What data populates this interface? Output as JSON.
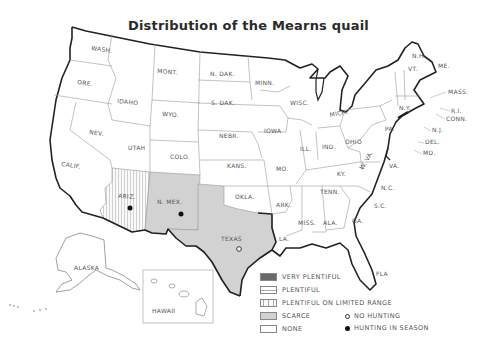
{
  "title": "Distribution of the Mearns quail",
  "colors": {
    "very_plentiful": "#6a6a6a",
    "plentiful": "#ffffff",
    "plentiful_limited": "#f4f4f4",
    "scarce": "#d2d2d2",
    "none": "#ffffff",
    "border": "#222222",
    "state_line": "#9a9a9a"
  },
  "states": {
    "wash": "WASH.",
    "ore": "ORE.",
    "calif": "CALIF.",
    "idaho": "IDAHO",
    "nev": "NEV.",
    "mont": "MONT.",
    "wyo": "WYO.",
    "utah": "UTAH",
    "colo": "COLO.",
    "ariz": "ARIZ.",
    "nmex": "N. MEX.",
    "ndak": "N. DAK.",
    "sdak": "S. DAK.",
    "nebr": "NEBR.",
    "kans": "KANS.",
    "okla": "OKLA.",
    "texas": "TEXAS",
    "minn": "MINN.",
    "iowa": "IOWA",
    "mo": "MO.",
    "ark": "ARK.",
    "la": "LA.",
    "wisc": "WISC.",
    "ill": "ILL.",
    "mich": "MICH.",
    "ind": "IND.",
    "ohio": "OHIO",
    "ky": "KY.",
    "tenn": "TENN.",
    "miss": "MISS.",
    "ala": "ALA.",
    "ga": "GA.",
    "fla": "FLA",
    "sc": "S.C.",
    "nc": "N.C.",
    "va": "VA.",
    "wva": "W. VA.",
    "pa": "PA.",
    "ny": "N.Y.",
    "vt": "VT.",
    "nh": "N.H.",
    "me": "ME.",
    "mass": "MASS.",
    "ri": "R.I.",
    "conn": "CONN.",
    "nj": "N.J.",
    "del": "DEL.",
    "md": "MD.",
    "alaska": "ALASKA",
    "hawaii": "HAWAII"
  },
  "legend": {
    "items": [
      {
        "label": "VERY PLENTIFUL",
        "key": "very_plentiful"
      },
      {
        "label": "PLENTIFUL",
        "key": "plentiful"
      },
      {
        "label": "PLENTIFUL ON LIMITED RANGE",
        "key": "plentiful_limited"
      },
      {
        "label": "SCARCE",
        "key": "scarce"
      },
      {
        "label": "NONE",
        "key": "none"
      }
    ],
    "hunting": [
      {
        "label": "NO HUNTING",
        "symbol": "open-circle"
      },
      {
        "label": "HUNTING IN SEASON",
        "symbol": "filled-circle"
      }
    ]
  },
  "status": {
    "ariz": {
      "category": "PLENTIFUL ON LIMITED RANGE",
      "hunting": "HUNTING IN SEASON"
    },
    "nmex": {
      "category": "SCARCE",
      "hunting": "HUNTING IN SEASON"
    },
    "texas": {
      "category": "SCARCE",
      "hunting": "NO HUNTING"
    }
  }
}
